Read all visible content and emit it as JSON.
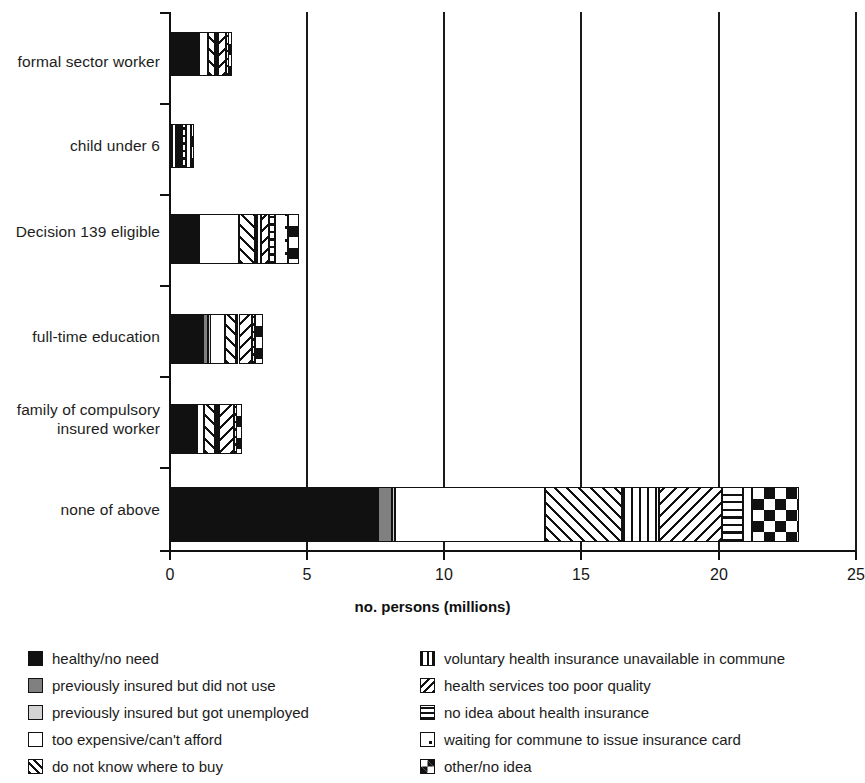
{
  "chart_data": {
    "type": "bar",
    "orientation": "horizontal",
    "stacked": true,
    "title": "",
    "xlabel": "no. persons (millions)",
    "ylabel": "",
    "xlim": [
      0,
      25
    ],
    "xticks": [
      0,
      5,
      10,
      15,
      20,
      25
    ],
    "xtick_labels": [
      "0",
      "5",
      "10",
      "15",
      "20",
      "25"
    ],
    "grid": true,
    "grid_axis": "x",
    "legend_position": "bottom",
    "categories": [
      "formal sector worker",
      "child under 6",
      "Decision 139 eligible",
      "full-time education",
      "family of compulsory\ninsured worker",
      "none of above"
    ],
    "series": [
      {
        "name": "healthy/no need",
        "pattern": "solid-black",
        "values": [
          1.0,
          0.05,
          1.0,
          1.2,
          0.95,
          7.6
        ]
      },
      {
        "name": "previously insured but did not use",
        "pattern": "dark-gray",
        "values": [
          0.03,
          0.02,
          0.04,
          0.2,
          0.03,
          0.5
        ]
      },
      {
        "name": "previously insured but got unemployed",
        "pattern": "light-gray",
        "values": [
          0.02,
          0.02,
          0.03,
          0.05,
          0.02,
          0.1
        ]
      },
      {
        "name": "too expensive/can't afford",
        "pattern": "white",
        "values": [
          0.35,
          0.12,
          1.45,
          0.55,
          0.25,
          5.5
        ]
      },
      {
        "name": "do not know where to buy",
        "pattern": "diagonal-up-hatch",
        "values": [
          0.25,
          0.1,
          0.6,
          0.4,
          0.4,
          2.8
        ]
      },
      {
        "name": "voluntary health insurance unavailable in commune",
        "pattern": "vertical-lines",
        "values": [
          0.1,
          0.05,
          0.2,
          0.1,
          0.15,
          1.35
        ]
      },
      {
        "name": "health services too poor quality",
        "pattern": "diagonal-down-hatch",
        "values": [
          0.3,
          0.08,
          0.3,
          0.5,
          0.55,
          2.3
        ]
      },
      {
        "name": "no idea about health insurance",
        "pattern": "horizontal-lines",
        "values": [
          0.05,
          0.15,
          0.2,
          0.05,
          0.05,
          0.75
        ]
      },
      {
        "name": "waiting for commune to issue insurance card",
        "pattern": "dotted",
        "values": [
          0.02,
          0.18,
          0.5,
          0.05,
          0.02,
          0.35
        ]
      },
      {
        "name": "other/no idea",
        "pattern": "checkerboard",
        "values": [
          0.15,
          0.08,
          0.4,
          0.3,
          0.2,
          1.7
        ]
      }
    ],
    "totals": [
      2.27,
      0.85,
      4.72,
      3.4,
      2.62,
      22.95
    ]
  },
  "axis": {
    "x_title": "no. persons (millions)",
    "x_tick_labels": [
      "0",
      "5",
      "10",
      "15",
      "20",
      "25"
    ]
  },
  "category_labels": [
    "formal sector worker",
    "child under 6",
    "Decision 139 eligible",
    "full-time education",
    "family of compulsory\ninsured worker",
    "none of above"
  ],
  "legend": {
    "left_column": [
      {
        "label": "healthy/no need",
        "pattern": "solid-black"
      },
      {
        "label": "previously insured but did not use",
        "pattern": "dark-gray"
      },
      {
        "label": "previously insured but got unemployed",
        "pattern": "light-gray"
      },
      {
        "label": "too expensive/can't afford",
        "pattern": "white"
      },
      {
        "label": "do not know where to buy",
        "pattern": "diagonal-up-hatch"
      }
    ],
    "right_column": [
      {
        "label": "voluntary health insurance unavailable in commune",
        "pattern": "vertical-lines"
      },
      {
        "label": "health services too poor quality",
        "pattern": "diagonal-down-hatch"
      },
      {
        "label": "no idea about health insurance",
        "pattern": "horizontal-lines"
      },
      {
        "label": "waiting for commune to issue insurance card",
        "pattern": "dotted"
      },
      {
        "label": "other/no idea",
        "pattern": "checkerboard"
      }
    ]
  },
  "colors": {
    "ink": "#111111",
    "dark_gray": "#808080",
    "light_gray": "#d3d3d3",
    "white": "#ffffff"
  }
}
